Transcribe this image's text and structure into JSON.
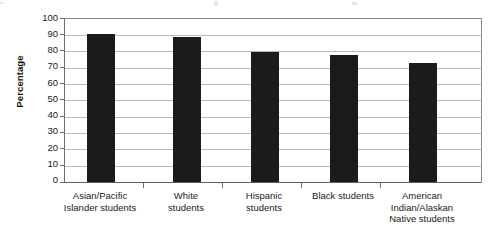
{
  "chart_data": {
    "type": "bar",
    "title": "",
    "xlabel": "",
    "ylabel": "Percentage",
    "ylim": [
      0,
      100
    ],
    "ytick_step": 10,
    "yticks": [
      100,
      90,
      80,
      70,
      60,
      50,
      40,
      30,
      20,
      10,
      0
    ],
    "grid": true,
    "legend": false,
    "legend_position": "none",
    "orientation": "vertical",
    "categories": [
      "Asian/Pacific Islander students",
      "White students",
      "Hispanic students",
      "Black students",
      "American Indian/Alaskan Native students"
    ],
    "category_lines": [
      [
        "Asian/Pacific",
        "Islander students"
      ],
      [
        "White",
        "students"
      ],
      [
        "Hispanic",
        "students"
      ],
      [
        "Black students"
      ],
      [
        "American",
        "Indian/Alaskan",
        "Native students"
      ]
    ],
    "values": [
      91,
      89,
      80,
      78,
      73
    ],
    "bar_color": "#1b1b1b",
    "gridline_color": "#b9b9b9",
    "axis_color": "#6e6e6e"
  }
}
